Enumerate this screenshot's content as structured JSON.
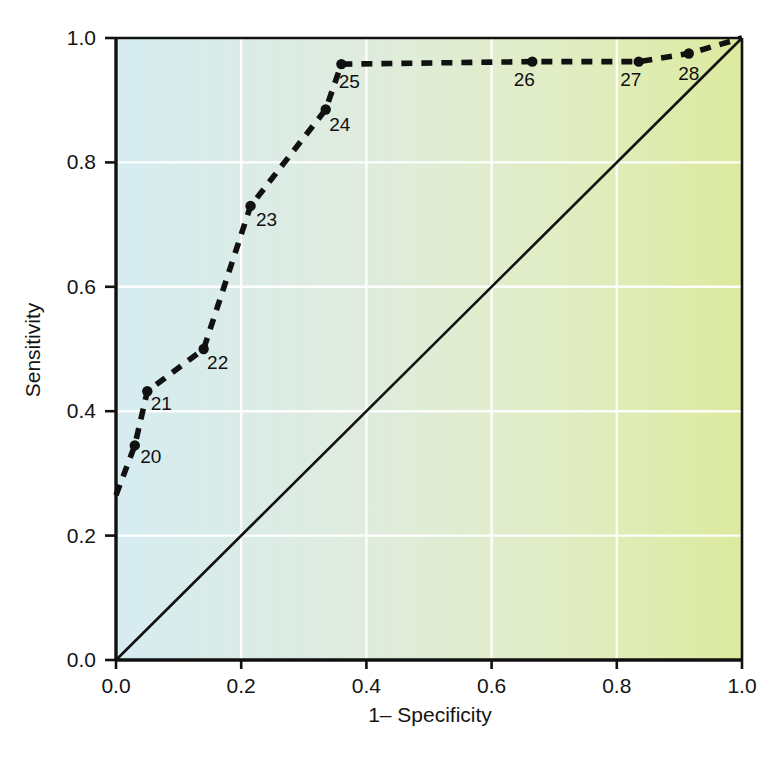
{
  "chart_data": {
    "type": "line",
    "title": "",
    "subtitle": "",
    "xlabel": "1– Specificity",
    "ylabel": "Sensitivity",
    "xlim": [
      0.0,
      1.0
    ],
    "ylim": [
      0.0,
      1.0
    ],
    "grid": true,
    "legend": "none",
    "xticks": [
      "0.0",
      "0.2",
      "0.4",
      "0.6",
      "0.8",
      "1.0"
    ],
    "xtick_values": [
      0.0,
      0.2,
      0.4,
      0.6,
      0.8,
      1.0
    ],
    "yticks": [
      "0.0",
      "0.2",
      "0.4",
      "0.6",
      "0.8",
      "1.0"
    ],
    "ytick_values": [
      0.0,
      0.2,
      0.4,
      0.6,
      0.8,
      1.0
    ],
    "series": [
      {
        "name": "ROC curve",
        "style": "dashed",
        "color": "#111111",
        "x": [
          0.0,
          0.03,
          0.05,
          0.14,
          0.215,
          0.335,
          0.36,
          0.665,
          0.835,
          0.915,
          1.0
        ],
        "y": [
          0.265,
          0.345,
          0.432,
          0.5,
          0.73,
          0.885,
          0.958,
          0.962,
          0.962,
          0.975,
          1.0
        ],
        "point_labels": [
          "",
          "20",
          "21",
          "22",
          "23",
          "24",
          "25",
          "26",
          "27",
          "28",
          ""
        ],
        "markers": [
          false,
          true,
          true,
          true,
          true,
          true,
          true,
          true,
          true,
          true,
          false
        ]
      },
      {
        "name": "reference diagonal",
        "style": "solid",
        "color": "#111111",
        "x": [
          0.0,
          1.0
        ],
        "y": [
          0.0,
          1.0
        ],
        "point_labels": [
          "",
          ""
        ],
        "markers": [
          false,
          false
        ]
      }
    ],
    "annotations": [
      {
        "text": "20",
        "x": 0.03,
        "y": 0.345,
        "dx": 16,
        "dy": 18
      },
      {
        "text": "21",
        "x": 0.05,
        "y": 0.432,
        "dx": 14,
        "dy": 19
      },
      {
        "text": "22",
        "x": 0.14,
        "y": 0.5,
        "dx": 14,
        "dy": 20
      },
      {
        "text": "23",
        "x": 0.215,
        "y": 0.73,
        "dx": 16,
        "dy": 20
      },
      {
        "text": "24",
        "x": 0.335,
        "y": 0.885,
        "dx": 14,
        "dy": 21
      },
      {
        "text": "25",
        "x": 0.36,
        "y": 0.958,
        "dx": 8,
        "dy": 24
      },
      {
        "text": "26",
        "x": 0.665,
        "y": 0.962,
        "dx": -8,
        "dy": 24
      },
      {
        "text": "27",
        "x": 0.835,
        "y": 0.962,
        "dx": -8,
        "dy": 24
      },
      {
        "text": "28",
        "x": 0.915,
        "y": 0.975,
        "dx": 0,
        "dy": 26
      }
    ],
    "background": {
      "gradient_from": "#d8ecf0",
      "gradient_to": "#dbeaa0",
      "gridline_color": "#ffffff",
      "axis_color": "#111111"
    }
  },
  "axes": {
    "x_title": "1– Specificity",
    "y_title": "Sensitivity",
    "x_tick_labels": [
      "0.0",
      "0.2",
      "0.4",
      "0.6",
      "0.8",
      "1.0"
    ],
    "y_tick_labels": [
      "0.0",
      "0.2",
      "0.4",
      "0.6",
      "0.8",
      "1.0"
    ]
  },
  "curve_labels": {
    "p20": "20",
    "p21": "21",
    "p22": "22",
    "p23": "23",
    "p24": "24",
    "p25": "25",
    "p26": "26",
    "p27": "27",
    "p28": "28"
  }
}
